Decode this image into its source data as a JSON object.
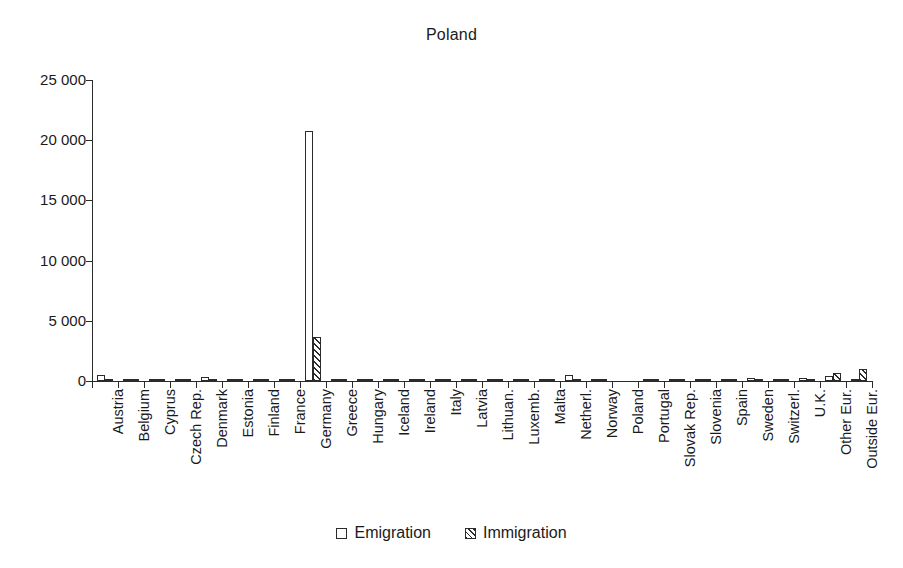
{
  "chart_data": {
    "type": "bar",
    "title": "Poland",
    "xlabel": "",
    "ylabel": "",
    "ylim": [
      0,
      25000
    ],
    "yticks": [
      0,
      5000,
      10000,
      15000,
      20000,
      25000
    ],
    "ytick_labels": [
      "0",
      "5 000",
      "10 000",
      "15 000",
      "20 000",
      "25 000"
    ],
    "grid": false,
    "legend_position": "bottom",
    "categories": [
      "Austria",
      "Belgium",
      "Cyprus",
      "Czech Rep.",
      "Denmark",
      "Estonia",
      "Finland",
      "France",
      "Germany",
      "Greece",
      "Hungary",
      "Iceland",
      "Ireland",
      "Italy",
      "Latvia",
      "Lithuan.",
      "Luxemb.",
      "Malta",
      "Netherl.",
      "Norway",
      "Poland",
      "Portugal",
      "Slovak Rep.",
      "Slovenia",
      "Spain",
      "Sweden",
      "Switzerl.",
      "U.K.",
      "Other Eur.",
      "Outside Eur."
    ],
    "series": [
      {
        "name": "Emigration",
        "style": "open",
        "values": [
          420,
          60,
          10,
          120,
          230,
          5,
          20,
          90,
          20700,
          10,
          15,
          5,
          20,
          110,
          10,
          10,
          15,
          5,
          400,
          120,
          0,
          10,
          60,
          10,
          30,
          170,
          110,
          190,
          340,
          120
        ]
      },
      {
        "name": "Immigration",
        "style": "hatched",
        "values": [
          40,
          25,
          5,
          60,
          30,
          5,
          10,
          50,
          3600,
          5,
          10,
          5,
          10,
          60,
          5,
          5,
          10,
          5,
          60,
          40,
          0,
          5,
          30,
          5,
          20,
          50,
          60,
          80,
          620,
          900
        ]
      }
    ]
  },
  "legend": {
    "items": [
      {
        "label": "Emigration",
        "swatch": "open-square-icon"
      },
      {
        "label": "Immigration",
        "swatch": "hatched-square-icon"
      }
    ]
  }
}
